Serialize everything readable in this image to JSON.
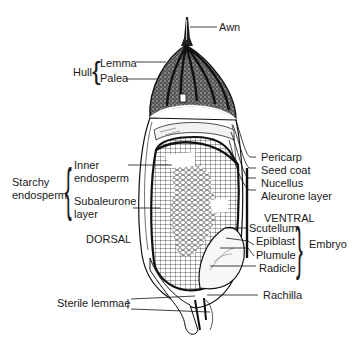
{
  "diagram": {
    "labels": {
      "awn": "Awn",
      "hull": "Hull",
      "lemma": "Lemma",
      "palea": "Palea",
      "pericarp": "Pericarp",
      "seed_coat": "Seed coat",
      "nucellus": "Nucellus",
      "aleurone_layer": "Aleurone layer",
      "ventral": "VENTRAL",
      "starchy_endosperm_1": "Starchy",
      "starchy_endosperm_2": "endosperm",
      "inner_endosperm_1": "Inner",
      "inner_endosperm_2": "endosperm",
      "subaleurone_1": "Subaleurone",
      "subaleurone_2": "layer",
      "dorsal": "DORSAL",
      "scutellum": "Scutellum",
      "epiblast": "Epiblast",
      "plumule": "Plumule",
      "radicle": "Radicle",
      "embryo": "Embryo",
      "rachilla": "Rachilla",
      "sterile_lemmae": "Sterile lemmae"
    },
    "groups": [
      {
        "name": "Hull",
        "members": [
          "Lemma",
          "Palea"
        ]
      },
      {
        "name": "Starchy endosperm",
        "members": [
          "Inner endosperm",
          "Subaleurone layer"
        ]
      },
      {
        "name": "Embryo",
        "members": [
          "Scutellum",
          "Epiblast",
          "Plumule",
          "Radicle"
        ]
      }
    ],
    "colors": {
      "ink": "#1a1a1a",
      "background": "#ffffff"
    }
  }
}
